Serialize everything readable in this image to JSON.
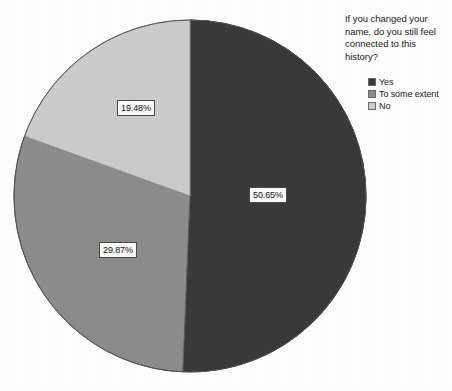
{
  "chart_data": {
    "type": "pie",
    "title": "If you changed your name, do you still feel connected to this history?",
    "title_lines": [
      "If you changed your",
      "name, do you still feel",
      "connected to this",
      "history?"
    ],
    "categories": [
      "Yes",
      "To some extent",
      "No"
    ],
    "values": [
      50.65,
      29.87,
      19.48
    ],
    "value_labels": [
      "50.65%",
      "29.87%",
      "19.48%"
    ],
    "unit": "%",
    "colors": [
      "#3a3a3a",
      "#8d8d8d",
      "#cdcdcd"
    ],
    "legend_position": "right",
    "start_angle_deg": 0,
    "direction": "clockwise",
    "grid": false,
    "xlabel": "",
    "ylabel": ""
  },
  "legend": {
    "items": [
      {
        "label": "Yes",
        "color": "#3a3a3a"
      },
      {
        "label": "To some extent",
        "color": "#8d8d8d"
      },
      {
        "label": "No",
        "color": "#cdcdcd"
      }
    ]
  },
  "labels": {
    "yes": "50.65%",
    "to_some_extent": "29.87%",
    "no": "19.48%"
  },
  "geometry": {
    "center_x": 190,
    "center_y": 196,
    "radius": 176
  }
}
